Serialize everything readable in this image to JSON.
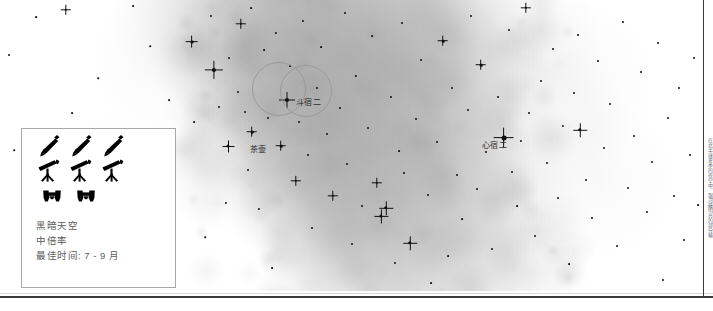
{
  "page": {
    "side_note": "在北半球夏季的夜空中，银河最明亮的部分横跨人马座与天蝎座"
  },
  "sky": {
    "background_color": "#ffffff",
    "milkyway_color": "#d9d9d9",
    "star_color": "#111111",
    "labels": [
      {
        "name": "nunki-label",
        "text": "斗宿二",
        "x": 296,
        "y": 99
      },
      {
        "name": "teapot-label",
        "text": "茶壶",
        "x": 250,
        "y": 146
      },
      {
        "name": "antares-label",
        "text": "心宿二",
        "x": 482,
        "y": 142
      }
    ],
    "fov_circles": [
      {
        "name": "fov-circle-1",
        "cx": 279,
        "cy": 89,
        "r": 27
      },
      {
        "name": "fov-circle-2",
        "cx": 306,
        "cy": 91,
        "r": 26
      }
    ],
    "stars": [
      {
        "x": 9,
        "y": 55,
        "r": 1.0
      },
      {
        "x": 14,
        "y": 150,
        "r": 0.8
      },
      {
        "x": 36,
        "y": 17,
        "r": 0.9
      },
      {
        "x": 66,
        "y": 10,
        "r": 1.2
      },
      {
        "x": 72,
        "y": 113,
        "r": 0.9
      },
      {
        "x": 98,
        "y": 78,
        "r": 0.8
      },
      {
        "x": 133,
        "y": 6,
        "r": 0.9
      },
      {
        "x": 150,
        "y": 46,
        "r": 0.8
      },
      {
        "x": 169,
        "y": 100,
        "r": 0.9
      },
      {
        "x": 192,
        "y": 42,
        "r": 1.4
      },
      {
        "x": 194,
        "y": 122,
        "r": 0.9
      },
      {
        "x": 205,
        "y": 237,
        "r": 0.8
      },
      {
        "x": 211,
        "y": 16,
        "r": 1.0
      },
      {
        "x": 214,
        "y": 70,
        "r": 2.1
      },
      {
        "x": 219,
        "y": 107,
        "r": 1.0
      },
      {
        "x": 226,
        "y": 203,
        "r": 1.1
      },
      {
        "x": 228,
        "y": 146,
        "r": 1.5
      },
      {
        "x": 229,
        "y": 58,
        "r": 1.0
      },
      {
        "x": 238,
        "y": 92,
        "r": 1.0
      },
      {
        "x": 241,
        "y": 24,
        "r": 1.2
      },
      {
        "x": 245,
        "y": 112,
        "r": 1.0
      },
      {
        "x": 248,
        "y": 170,
        "r": 1.0
      },
      {
        "x": 251,
        "y": 8,
        "r": 0.9
      },
      {
        "x": 252,
        "y": 132,
        "r": 1.3
      },
      {
        "x": 259,
        "y": 209,
        "r": 1.1
      },
      {
        "x": 264,
        "y": 50,
        "r": 0.9
      },
      {
        "x": 268,
        "y": 118,
        "r": 1.0
      },
      {
        "x": 272,
        "y": 268,
        "r": 0.9
      },
      {
        "x": 276,
        "y": 33,
        "r": 1.1
      },
      {
        "x": 281,
        "y": 146,
        "r": 1.3
      },
      {
        "x": 287,
        "y": 100,
        "r": 2.0
      },
      {
        "x": 290,
        "y": 66,
        "r": 0.9
      },
      {
        "x": 296,
        "y": 181,
        "r": 1.2
      },
      {
        "x": 299,
        "y": 122,
        "r": 1.0
      },
      {
        "x": 303,
        "y": 21,
        "r": 1.0
      },
      {
        "x": 308,
        "y": 155,
        "r": 1.0
      },
      {
        "x": 312,
        "y": 228,
        "r": 1.0
      },
      {
        "x": 317,
        "y": 88,
        "r": 1.1
      },
      {
        "x": 321,
        "y": 47,
        "r": 0.9
      },
      {
        "x": 327,
        "y": 134,
        "r": 1.0
      },
      {
        "x": 333,
        "y": 196,
        "r": 1.2
      },
      {
        "x": 340,
        "y": 108,
        "r": 1.0
      },
      {
        "x": 345,
        "y": 13,
        "r": 1.0
      },
      {
        "x": 347,
        "y": 164,
        "r": 1.0
      },
      {
        "x": 352,
        "y": 244,
        "r": 1.0
      },
      {
        "x": 356,
        "y": 76,
        "r": 1.1
      },
      {
        "x": 362,
        "y": 206,
        "r": 1.0
      },
      {
        "x": 368,
        "y": 128,
        "r": 1.0
      },
      {
        "x": 372,
        "y": 36,
        "r": 0.9
      },
      {
        "x": 377,
        "y": 183,
        "r": 1.2
      },
      {
        "x": 381,
        "y": 216,
        "r": 1.6
      },
      {
        "x": 386,
        "y": 208,
        "r": 1.7
      },
      {
        "x": 391,
        "y": 97,
        "r": 1.0
      },
      {
        "x": 395,
        "y": 263,
        "r": 1.0
      },
      {
        "x": 399,
        "y": 151,
        "r": 0.9
      },
      {
        "x": 402,
        "y": 23,
        "r": 1.0
      },
      {
        "x": 404,
        "y": 173,
        "r": 1.0
      },
      {
        "x": 410,
        "y": 243,
        "r": 1.7
      },
      {
        "x": 416,
        "y": 119,
        "r": 1.0
      },
      {
        "x": 421,
        "y": 60,
        "r": 1.0
      },
      {
        "x": 428,
        "y": 195,
        "r": 1.0
      },
      {
        "x": 431,
        "y": 283,
        "r": 0.9
      },
      {
        "x": 437,
        "y": 142,
        "r": 1.0
      },
      {
        "x": 443,
        "y": 41,
        "r": 1.3
      },
      {
        "x": 448,
        "y": 256,
        "r": 0.9
      },
      {
        "x": 452,
        "y": 88,
        "r": 1.0
      },
      {
        "x": 457,
        "y": 175,
        "r": 1.0
      },
      {
        "x": 462,
        "y": 219,
        "r": 0.9
      },
      {
        "x": 468,
        "y": 110,
        "r": 1.0
      },
      {
        "x": 471,
        "y": 16,
        "r": 1.0
      },
      {
        "x": 477,
        "y": 189,
        "r": 1.0
      },
      {
        "x": 481,
        "y": 65,
        "r": 1.3
      },
      {
        "x": 486,
        "y": 152,
        "r": 1.0
      },
      {
        "x": 492,
        "y": 249,
        "r": 1.0
      },
      {
        "x": 498,
        "y": 97,
        "r": 1.0
      },
      {
        "x": 504,
        "y": 138,
        "r": 2.4
      },
      {
        "x": 509,
        "y": 30,
        "r": 1.0
      },
      {
        "x": 512,
        "y": 172,
        "r": 1.0
      },
      {
        "x": 517,
        "y": 206,
        "r": 0.9
      },
      {
        "x": 521,
        "y": 141,
        "r": 1.1
      },
      {
        "x": 526,
        "y": 8,
        "r": 1.2
      },
      {
        "x": 529,
        "y": 113,
        "r": 1.0
      },
      {
        "x": 535,
        "y": 236,
        "r": 1.0
      },
      {
        "x": 541,
        "y": 81,
        "r": 1.0
      },
      {
        "x": 547,
        "y": 163,
        "r": 1.0
      },
      {
        "x": 553,
        "y": 49,
        "r": 1.0
      },
      {
        "x": 558,
        "y": 198,
        "r": 1.0
      },
      {
        "x": 563,
        "y": 126,
        "r": 1.1
      },
      {
        "x": 569,
        "y": 264,
        "r": 0.9
      },
      {
        "x": 574,
        "y": 93,
        "r": 1.0
      },
      {
        "x": 578,
        "y": 35,
        "r": 1.0
      },
      {
        "x": 580,
        "y": 130,
        "r": 1.7
      },
      {
        "x": 586,
        "y": 180,
        "r": 1.0
      },
      {
        "x": 592,
        "y": 218,
        "r": 1.0
      },
      {
        "x": 598,
        "y": 61,
        "r": 1.0
      },
      {
        "x": 604,
        "y": 148,
        "r": 1.0
      },
      {
        "x": 610,
        "y": 104,
        "r": 1.0
      },
      {
        "x": 617,
        "y": 246,
        "r": 1.0
      },
      {
        "x": 623,
        "y": 22,
        "r": 1.0
      },
      {
        "x": 628,
        "y": 188,
        "r": 1.0
      },
      {
        "x": 634,
        "y": 136,
        "r": 1.0
      },
      {
        "x": 641,
        "y": 72,
        "r": 1.0
      },
      {
        "x": 647,
        "y": 212,
        "r": 1.0
      },
      {
        "x": 652,
        "y": 162,
        "r": 1.0
      },
      {
        "x": 658,
        "y": 43,
        "r": 1.0
      },
      {
        "x": 663,
        "y": 280,
        "r": 1.0
      },
      {
        "x": 668,
        "y": 118,
        "r": 1.0
      },
      {
        "x": 674,
        "y": 196,
        "r": 1.0
      },
      {
        "x": 679,
        "y": 88,
        "r": 1.0
      },
      {
        "x": 684,
        "y": 240,
        "r": 1.0
      },
      {
        "x": 690,
        "y": 155,
        "r": 1.0
      },
      {
        "x": 694,
        "y": 58,
        "r": 1.0
      },
      {
        "x": 698,
        "y": 205,
        "r": 0.9
      }
    ]
  },
  "legend": {
    "name": "observing-conditions-legend",
    "icons": {
      "row1": {
        "name": "rocket-icon",
        "count": 3
      },
      "row2": {
        "name": "telescope-icon",
        "count": 3
      },
      "row3": {
        "name": "binoculars-icon",
        "count": 2
      }
    },
    "lines": [
      "黑暗天空",
      "中倍率",
      "最佳时间: 7 - 9 月"
    ]
  }
}
